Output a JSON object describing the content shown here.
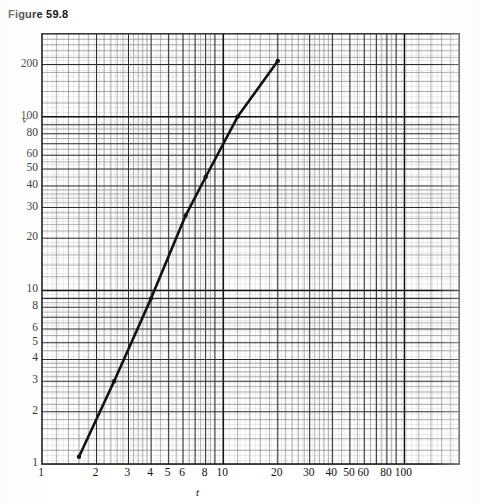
{
  "figure": {
    "title": "Figure 59.8"
  },
  "axes": {
    "x": {
      "label": "t",
      "scale": "log",
      "min": 1,
      "max": 200,
      "tick_labels": [
        "1",
        "2",
        "3",
        "4",
        "5",
        "6",
        "8",
        "10",
        "20",
        "30",
        "40",
        "50",
        "60",
        "80",
        "100"
      ],
      "tick_values": [
        1,
        2,
        3,
        4,
        5,
        6,
        8,
        10,
        20,
        30,
        40,
        50,
        60,
        80,
        100
      ]
    },
    "y": {
      "label": "v",
      "scale": "log",
      "min": 1,
      "max": 300,
      "tick_labels": [
        "1",
        "2",
        "3",
        "4",
        "5",
        "6",
        "8",
        "10",
        "20",
        "30",
        "40",
        "50",
        "60",
        "80",
        "100",
        "200"
      ],
      "tick_values": [
        1,
        2,
        3,
        4,
        5,
        6,
        8,
        10,
        20,
        30,
        40,
        50,
        60,
        80,
        100,
        200
      ]
    }
  },
  "chart_data": {
    "type": "line",
    "title": "Figure 59.8",
    "subtitle": "",
    "xlabel": "t",
    "ylabel": "v",
    "xscale": "log",
    "yscale": "log",
    "xlim": [
      1,
      200
    ],
    "ylim": [
      1,
      300
    ],
    "grid": "log-log graph paper, major and minor decade rulings",
    "legend": "none",
    "series": [
      {
        "name": "v vs t",
        "x": [
          1.6,
          2.5,
          4.0,
          6.2,
          8.0,
          12.0,
          20.0
        ],
        "y": [
          1.1,
          3.0,
          9.0,
          27.0,
          45.0,
          100.0,
          210.0
        ],
        "marker": "dot",
        "line_style": "solid",
        "color": "#111111",
        "relationship": "straight line on log-log axes (power law)",
        "log_slope": 2.08
      }
    ],
    "annotations": [],
    "grid_on": true,
    "legend_position": "none"
  }
}
